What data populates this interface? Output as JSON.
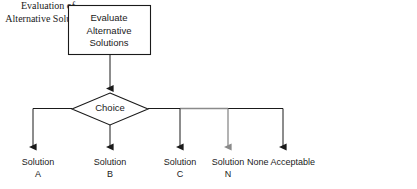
{
  "diagram": {
    "process_box": {
      "label": "Evaluate\nAlternative\nSolutions"
    },
    "decision": {
      "label": "Choice"
    },
    "terminals": [
      {
        "id": "a",
        "label": "Solution\nA"
      },
      {
        "id": "b",
        "label": "Solution\nB"
      },
      {
        "id": "c",
        "label": "Solution\nC"
      },
      {
        "id": "n",
        "label": "Solution\nN"
      },
      {
        "id": "none",
        "label": "None Acceptable"
      }
    ],
    "caption": "Evaluation of\nAlternative\nSolutions",
    "colors": {
      "stroke": "#1a1a1a",
      "muted_stroke": "#8a8a8a",
      "background": "#ffffff",
      "text": "#1a1a1a"
    }
  }
}
